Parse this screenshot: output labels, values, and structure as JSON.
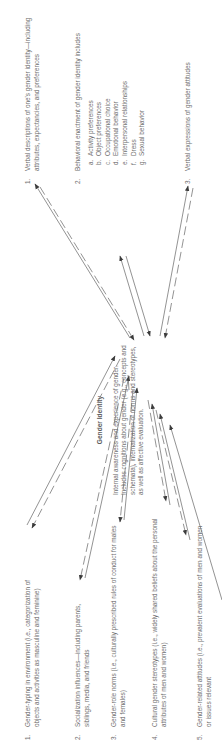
{
  "diagram": {
    "orientation": "rotated 90 degrees counter-clockwise",
    "inputs": [
      {
        "num": "1.",
        "text": "Gender-typing in environment (i.e., categorization of objects and activities as masculine and feminine)"
      },
      {
        "num": "2.",
        "text": "Socialization influences—including parents, siblings, media, and friends"
      },
      {
        "num": "3.",
        "text": "Gender-role norms (i.e., culturally prescribed rules of conduct for males and females)"
      },
      {
        "num": "4.",
        "text": "Cultural gender stereotypes (i.e., widely shared beliefs about the personal attributes of men and women)"
      },
      {
        "num": "5.",
        "text": "Gender-related attitudes (i.e., prevalent evaluations of men and women or issues relevant"
      }
    ],
    "center": {
      "title": "Gender Identity",
      "text": "Internal awareness and experience of gender. Includes cognitions about gender (e.g., concepts and schemata), internalization of norms and stereotypes, as well as affective evaluation."
    },
    "outputs": [
      {
        "num": "1.",
        "text": "Verbal descriptions of one's gender identity—including attributes, expectancies, and preferences"
      },
      {
        "num": "2.",
        "text": "Behavioral enactment of gender identity includes",
        "subitems": [
          {
            "letter": "a.",
            "text": "Activity preferences"
          },
          {
            "letter": "b.",
            "text": "Object preferences"
          },
          {
            "letter": "c.",
            "text": "Occupational choice"
          },
          {
            "letter": "d.",
            "text": "Emotional behavior"
          },
          {
            "letter": "e.",
            "text": "Interpersonal relationships"
          },
          {
            "letter": "f.",
            "text": "Dress"
          },
          {
            "letter": "g.",
            "text": "Sexual behavior"
          }
        ]
      },
      {
        "num": "3.",
        "text": "Verbal expressions of gender attitudes"
      }
    ],
    "colors": {
      "text": "#6e6e6e",
      "arrow": "#4a4a4a"
    }
  }
}
